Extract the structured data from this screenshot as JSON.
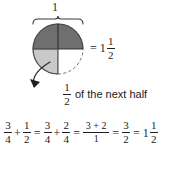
{
  "figure": {
    "colors": {
      "dark_shade": "#6f6f6f",
      "light_shade": "#c9c9c9",
      "unshaded": "#ffffff",
      "stroke": "#3a3a3a",
      "text": "#1a1a1a"
    },
    "brace": {
      "label": "1"
    },
    "circle": {
      "quadrants": [
        {
          "name": "top-left",
          "fill": "dark"
        },
        {
          "name": "top-right",
          "fill": "dark"
        },
        {
          "name": "bottom-left",
          "fill": "light"
        },
        {
          "name": "bottom-right",
          "fill": "none"
        }
      ]
    },
    "result": {
      "equals": "=",
      "whole": "1",
      "numerator": "1",
      "denominator": "2"
    },
    "caption": {
      "numerator": "1",
      "denominator": "2",
      "text": "of the next half"
    }
  },
  "equation": {
    "terms": [
      {
        "type": "fraction",
        "numerator": "3",
        "denominator": "4"
      },
      {
        "type": "operator",
        "symbol": "+"
      },
      {
        "type": "fraction",
        "numerator": "1",
        "denominator": "2"
      },
      {
        "type": "operator",
        "symbol": "="
      },
      {
        "type": "fraction",
        "numerator": "3",
        "denominator": "4"
      },
      {
        "type": "operator",
        "symbol": "+"
      },
      {
        "type": "fraction",
        "numerator": "2",
        "denominator": "4"
      },
      {
        "type": "operator",
        "symbol": "="
      },
      {
        "type": "fraction",
        "numerator": "3 + 2",
        "denominator": "1"
      },
      {
        "type": "operator",
        "symbol": "="
      },
      {
        "type": "fraction",
        "numerator": "3",
        "denominator": "2"
      },
      {
        "type": "operator",
        "symbol": "="
      },
      {
        "type": "mixed",
        "whole": "1",
        "numerator": "1",
        "denominator": "2"
      }
    ]
  }
}
